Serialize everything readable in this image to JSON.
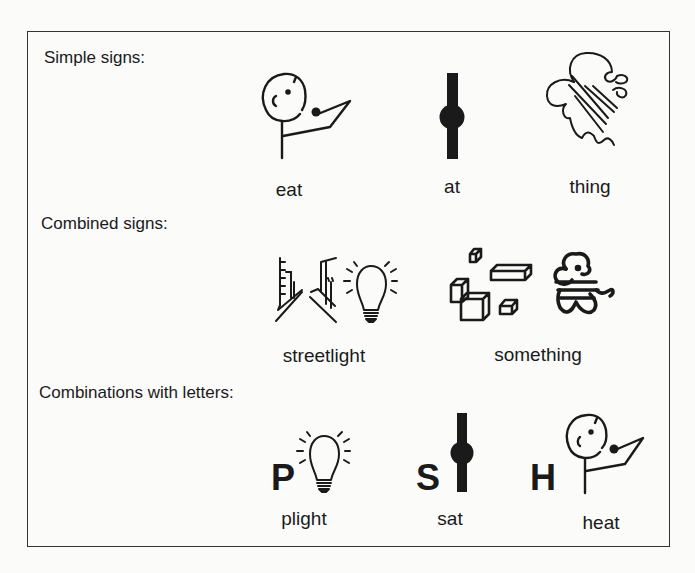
{
  "sections": [
    {
      "label": "Simple signs:",
      "signs": [
        {
          "word": "eat",
          "icon": "person-eating-icon"
        },
        {
          "word": "at",
          "icon": "bar-with-dot-icon"
        },
        {
          "word": "thing",
          "icon": "squiggle-thing-icon"
        }
      ]
    },
    {
      "label": "Combined signs:",
      "signs": [
        {
          "word": "streetlight",
          "icon": "street-and-lightbulb-icon"
        },
        {
          "word": "something",
          "icon": "blocks-and-thing-icon"
        }
      ]
    },
    {
      "label": "Combinations with letters:",
      "signs": [
        {
          "word": "plight",
          "letter": "P",
          "icon": "lightbulb-icon"
        },
        {
          "word": "sat",
          "letter": "S",
          "icon": "bar-with-dot-icon"
        },
        {
          "word": "heat",
          "letter": "H",
          "icon": "person-eating-icon"
        }
      ]
    }
  ]
}
